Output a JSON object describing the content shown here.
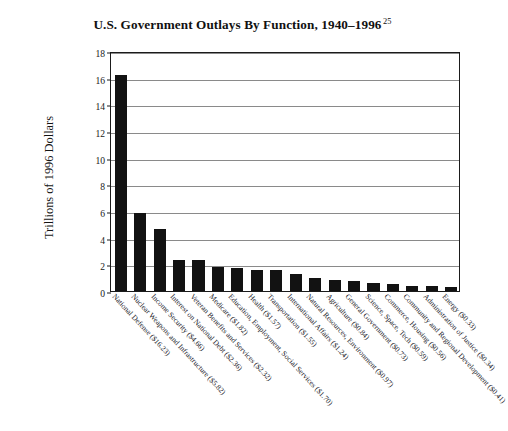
{
  "title": {
    "text": "U.S. Government Outlays By Function, 1940–1996",
    "footnote_marker": "25"
  },
  "axes": {
    "y_title": "Trillions of 1996 Dollars",
    "y_ticks": [
      "0",
      "2",
      "4",
      "6",
      "8",
      "10",
      "12",
      "14",
      "16",
      "18"
    ],
    "y_min": 0,
    "y_max": 18,
    "x_title": ""
  },
  "chart_data": {
    "type": "bar",
    "title": "U.S. Government Outlays By Function, 1940–1996",
    "xlabel": "",
    "ylabel": "Trillions of 1996 Dollars",
    "ylim": [
      0,
      18
    ],
    "ytick_step": 2,
    "grid": true,
    "legend": "none",
    "bar_color": "#121212",
    "categories": [
      "National Defense ($16.23)",
      "Nuclear Weapons and Infrastructure ($5.82)",
      "Income Security ($4.66)",
      "Interest on National Debt ($2.36)",
      "Veteran Benefits and Services ($2.32)",
      "Medicare ($1.82)",
      "Education, Employment, Social Services ($1.70)",
      "Health ($1.57)",
      "Transportation ($1.55)",
      "International Affairs ($1.24)",
      "Natural Resources, Environment ($0.97)",
      "Agriculture ($0.84)",
      "General Government ($0.73)",
      "Science, Space, Tech ($0.59)",
      "Commerce, Housing ($0.56)",
      "Community and Regional Development ($0.41)",
      "Administration of Justice ($0.34)",
      "Energy ($0.33)"
    ],
    "category_names": [
      "National Defense",
      "Nuclear Weapons and Infrastructure",
      "Income Security",
      "Interest on National Debt",
      "Veteran Benefits and Services",
      "Medicare",
      "Education, Employment, Social Services",
      "Health",
      "Transportation",
      "International Affairs",
      "Natural Resources, Environment",
      "Agriculture",
      "General Government",
      "Science, Space, Tech",
      "Commerce, Housing",
      "Community and Regional Development",
      "Administration of Justice",
      "Energy"
    ],
    "values": [
      16.23,
      5.82,
      4.66,
      2.36,
      2.32,
      1.82,
      1.7,
      1.57,
      1.55,
      1.24,
      0.97,
      0.84,
      0.73,
      0.59,
      0.56,
      0.41,
      0.34,
      0.33
    ],
    "value_labels": [
      "$16.23",
      "$5.82",
      "$4.66",
      "$2.36",
      "$2.32",
      "$1.82",
      "$1.70",
      "$1.57",
      "$1.55",
      "$1.24",
      "$0.97",
      "$0.84",
      "$0.73",
      "$0.59",
      "$0.56",
      "$0.41",
      "$0.34",
      "$0.33"
    ],
    "units": "trillions of 1996 dollars"
  }
}
